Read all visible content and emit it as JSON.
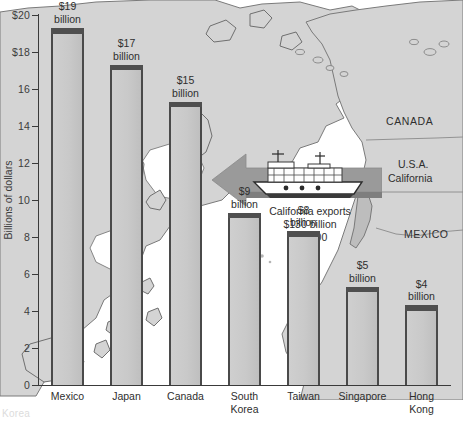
{
  "chart_data": {
    "type": "bar",
    "title": "",
    "xlabel": "",
    "ylabel": "Billions of dollars",
    "ylim": [
      0,
      20
    ],
    "grid": false,
    "legend": null,
    "categories": [
      "Mexico",
      "Japan",
      "Canada",
      "South Korea",
      "Taiwan",
      "Singapore",
      "Hong Kong"
    ],
    "category_lines": [
      [
        "Mexico"
      ],
      [
        "Japan"
      ],
      [
        "Canada"
      ],
      [
        "South",
        "Korea"
      ],
      [
        "Taiwan"
      ],
      [
        "Singapore"
      ],
      [
        "Hong",
        "Kong"
      ]
    ],
    "values": [
      19,
      17,
      15,
      9,
      8,
      5,
      4
    ],
    "value_labels": [
      [
        "$19",
        "billion"
      ],
      [
        "$17",
        "billion"
      ],
      [
        "$15",
        "billion"
      ],
      [
        "$9",
        "billion"
      ],
      [
        "$8",
        "billion"
      ],
      [
        "$5",
        "billion"
      ],
      [
        "$4",
        "billion"
      ]
    ],
    "ytick_values": [
      0,
      2,
      4,
      6,
      8,
      10,
      12,
      14,
      16,
      18,
      20
    ],
    "ytick_labels": [
      "0",
      "2",
      "4",
      "6",
      "8",
      "10",
      "12",
      "14",
      "16",
      "$18",
      "$20"
    ],
    "annotations": [
      {
        "name": "california-exports-note",
        "lines": [
          "California exports",
          "$130 billion",
          "in 2000"
        ]
      }
    ]
  },
  "map": {
    "labels": [
      {
        "name": "canada",
        "text": "CANADA"
      },
      {
        "name": "usa",
        "text": "U.S.A."
      },
      {
        "name": "california",
        "text": "California"
      },
      {
        "name": "mexico",
        "text": "MEXICO"
      }
    ]
  },
  "colors": {
    "bar_fill": "#c9c9c9",
    "bar_edge": "#4a4a4a",
    "bar_cap": "#4f4f4f",
    "axis": "#3a3a3a",
    "text": "#2e2e2e",
    "land": "#d4d4d4",
    "land_stroke": "#7a7a7a",
    "ocean": "#ffffff",
    "arrow": "#9a9a9a"
  },
  "caption_fragment": "Korea"
}
